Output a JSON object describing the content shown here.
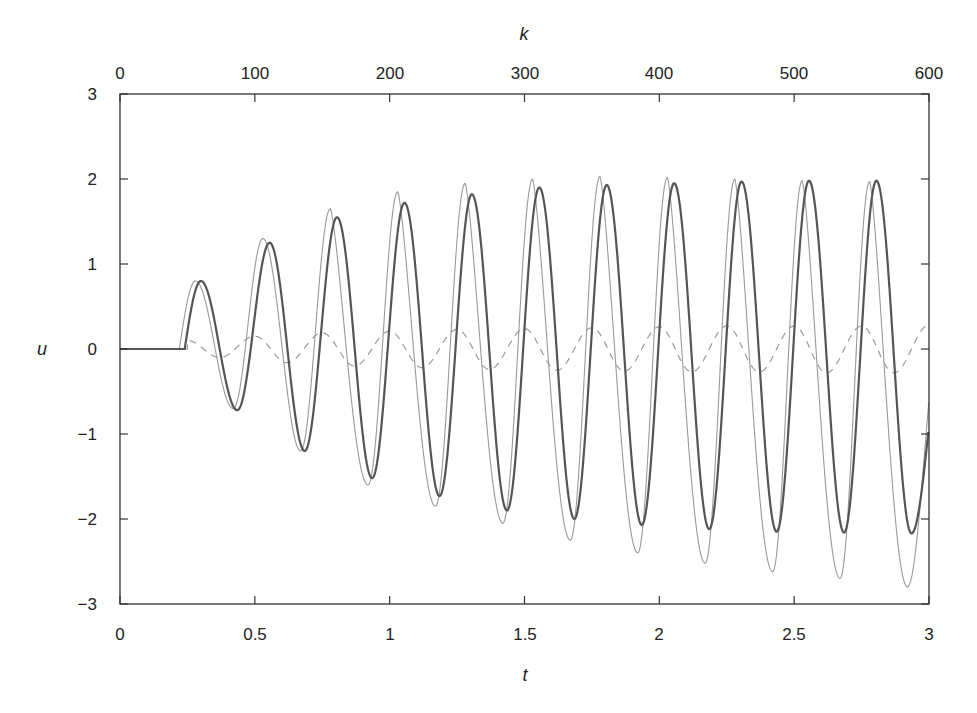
{
  "chart_data": {
    "type": "line",
    "title": "",
    "xlabel": "t",
    "ylabel": "u",
    "x2label": "k",
    "xlim": [
      0,
      3
    ],
    "ylim": [
      -3,
      3
    ],
    "x2lim": [
      0,
      600
    ],
    "grid": false,
    "legend": null,
    "xticks": [
      "0",
      "0.5",
      "1",
      "1.5",
      "2",
      "2.5",
      "3"
    ],
    "xtick_values": [
      0,
      0.5,
      1,
      1.5,
      2,
      2.5,
      3
    ],
    "yticks": [
      "3",
      "2",
      "1",
      "0",
      "−1",
      "−2",
      "−3"
    ],
    "ytick_values": [
      3,
      2,
      1,
      0,
      -1,
      -2,
      -3
    ],
    "x2ticks": [
      "0",
      "100",
      "200",
      "300",
      "400",
      "500",
      "600"
    ],
    "x2tick_values": [
      0,
      100,
      200,
      300,
      400,
      500,
      600
    ],
    "series": [
      {
        "name": "reference (thin light line)",
        "style": "solid-thin",
        "color": "#9a9a9a",
        "onset_t": 0.22,
        "peaks": [
          {
            "t": 0.28,
            "u": 0.8
          },
          {
            "t": 0.53,
            "u": 1.3
          },
          {
            "t": 0.78,
            "u": 1.65
          },
          {
            "t": 1.03,
            "u": 1.85
          },
          {
            "t": 1.28,
            "u": 1.95
          },
          {
            "t": 1.53,
            "u": 2.0
          },
          {
            "t": 1.78,
            "u": 2.03
          },
          {
            "t": 2.03,
            "u": 2.02
          },
          {
            "t": 2.28,
            "u": 2.0
          },
          {
            "t": 2.53,
            "u": 1.98
          },
          {
            "t": 2.78,
            "u": 1.97
          }
        ],
        "troughs": [
          {
            "t": 0.42,
            "u": -0.7
          },
          {
            "t": 0.67,
            "u": -1.2
          },
          {
            "t": 0.92,
            "u": -1.6
          },
          {
            "t": 1.17,
            "u": -1.85
          },
          {
            "t": 1.42,
            "u": -2.05
          },
          {
            "t": 1.67,
            "u": -2.25
          },
          {
            "t": 1.92,
            "u": -2.4
          },
          {
            "t": 2.17,
            "u": -2.52
          },
          {
            "t": 2.42,
            "u": -2.62
          },
          {
            "t": 2.67,
            "u": -2.7
          },
          {
            "t": 2.92,
            "u": -2.8
          }
        ]
      },
      {
        "name": "response (thick dark line)",
        "style": "solid-thick",
        "color": "#555555",
        "onset_t": 0.24,
        "peaks": [
          {
            "t": 0.3,
            "u": 0.8
          },
          {
            "t": 0.555,
            "u": 1.25
          },
          {
            "t": 0.805,
            "u": 1.55
          },
          {
            "t": 1.055,
            "u": 1.72
          },
          {
            "t": 1.305,
            "u": 1.82
          },
          {
            "t": 1.555,
            "u": 1.9
          },
          {
            "t": 1.805,
            "u": 1.93
          },
          {
            "t": 2.055,
            "u": 1.95
          },
          {
            "t": 2.305,
            "u": 1.97
          },
          {
            "t": 2.555,
            "u": 1.98
          },
          {
            "t": 2.805,
            "u": 1.98
          }
        ],
        "troughs": [
          {
            "t": 0.435,
            "u": -0.72
          },
          {
            "t": 0.685,
            "u": -1.2
          },
          {
            "t": 0.935,
            "u": -1.52
          },
          {
            "t": 1.185,
            "u": -1.73
          },
          {
            "t": 1.435,
            "u": -1.9
          },
          {
            "t": 1.685,
            "u": -2.0
          },
          {
            "t": 1.935,
            "u": -2.07
          },
          {
            "t": 2.185,
            "u": -2.12
          },
          {
            "t": 2.435,
            "u": -2.15
          },
          {
            "t": 2.685,
            "u": -2.16
          },
          {
            "t": 2.935,
            "u": -2.17
          }
        ]
      },
      {
        "name": "dashed signal",
        "style": "dashed",
        "color": "#9a9a9a",
        "onset_t": 0.25,
        "peaks": [
          {
            "t": 0.25,
            "u": 0.1
          },
          {
            "t": 0.5,
            "u": 0.15
          },
          {
            "t": 0.75,
            "u": 0.19
          },
          {
            "t": 1.0,
            "u": 0.21
          },
          {
            "t": 1.25,
            "u": 0.23
          },
          {
            "t": 1.5,
            "u": 0.24
          },
          {
            "t": 1.75,
            "u": 0.25
          },
          {
            "t": 2.0,
            "u": 0.26
          },
          {
            "t": 2.25,
            "u": 0.27
          },
          {
            "t": 2.5,
            "u": 0.27
          },
          {
            "t": 2.75,
            "u": 0.27
          },
          {
            "t": 3.0,
            "u": 0.28
          }
        ],
        "troughs": [
          {
            "t": 0.37,
            "u": -0.1
          },
          {
            "t": 0.62,
            "u": -0.16
          },
          {
            "t": 0.87,
            "u": -0.2
          },
          {
            "t": 1.12,
            "u": -0.22
          },
          {
            "t": 1.37,
            "u": -0.24
          },
          {
            "t": 1.62,
            "u": -0.25
          },
          {
            "t": 1.87,
            "u": -0.26
          },
          {
            "t": 2.12,
            "u": -0.27
          },
          {
            "t": 2.37,
            "u": -0.27
          },
          {
            "t": 2.62,
            "u": -0.28
          },
          {
            "t": 2.87,
            "u": -0.28
          }
        ]
      }
    ]
  }
}
